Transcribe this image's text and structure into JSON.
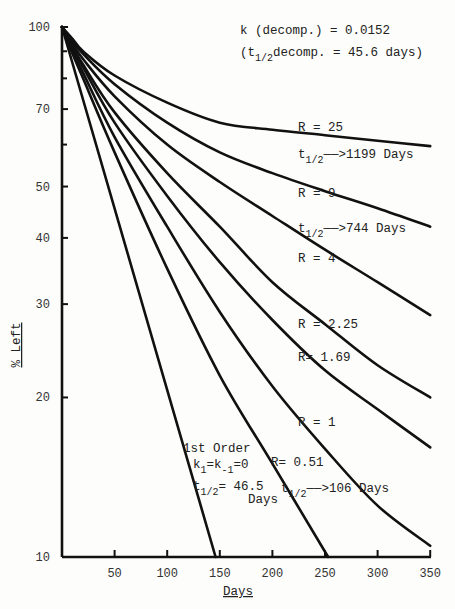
{
  "chart_data": {
    "type": "line",
    "title": "",
    "xlabel": "Days",
    "ylabel": "% Left",
    "xscale": "linear",
    "yscale": "log",
    "xlim": [
      0,
      350
    ],
    "ylim": [
      10,
      100
    ],
    "x_ticks": [
      50,
      100,
      150,
      200,
      250,
      300,
      350
    ],
    "y_ticks": [
      10,
      20,
      30,
      40,
      50,
      70,
      100
    ],
    "y_minor_ticks": [
      60,
      80,
      90
    ],
    "grid": false,
    "legend": "none (inline labels)",
    "series": [
      {
        "name": "1st Order (k1=k-1=0)",
        "points": [
          [
            0,
            100
          ],
          [
            146,
            10
          ]
        ]
      },
      {
        "name": "R = 0.51",
        "points": [
          [
            0,
            100
          ],
          [
            10,
            89
          ],
          [
            20,
            80
          ],
          [
            50,
            58
          ],
          [
            100,
            35
          ],
          [
            150,
            22
          ],
          [
            200,
            15
          ],
          [
            253,
            10
          ]
        ]
      },
      {
        "name": "R = 1",
        "points": [
          [
            0,
            100
          ],
          [
            10,
            90
          ],
          [
            20,
            82
          ],
          [
            50,
            62
          ],
          [
            100,
            42
          ],
          [
            150,
            29
          ],
          [
            200,
            21
          ],
          [
            250,
            16
          ],
          [
            300,
            12.5
          ],
          [
            350,
            10.5
          ]
        ]
      },
      {
        "name": "R = 1.69",
        "points": [
          [
            0,
            100
          ],
          [
            10,
            91
          ],
          [
            20,
            84
          ],
          [
            50,
            66
          ],
          [
            100,
            48
          ],
          [
            150,
            36
          ],
          [
            200,
            28
          ],
          [
            250,
            22.5
          ],
          [
            300,
            19
          ],
          [
            350,
            16.1
          ]
        ]
      },
      {
        "name": "R = 2.25",
        "points": [
          [
            0,
            100
          ],
          [
            10,
            92
          ],
          [
            20,
            85
          ],
          [
            50,
            69
          ],
          [
            100,
            53
          ],
          [
            150,
            42
          ],
          [
            200,
            33
          ],
          [
            250,
            27.5
          ],
          [
            300,
            23
          ],
          [
            350,
            20
          ]
        ]
      },
      {
        "name": "R = 4",
        "points": [
          [
            0,
            100
          ],
          [
            10,
            93
          ],
          [
            20,
            87
          ],
          [
            50,
            74
          ],
          [
            100,
            60
          ],
          [
            150,
            51
          ],
          [
            200,
            44
          ],
          [
            250,
            38
          ],
          [
            300,
            33
          ],
          [
            350,
            28.6
          ]
        ]
      },
      {
        "name": "R = 9",
        "points": [
          [
            0,
            100
          ],
          [
            10,
            94
          ],
          [
            20,
            89
          ],
          [
            50,
            78
          ],
          [
            100,
            66
          ],
          [
            150,
            58
          ],
          [
            200,
            53
          ],
          [
            250,
            49
          ],
          [
            300,
            45.5
          ],
          [
            350,
            42
          ]
        ]
      },
      {
        "name": "R = 25",
        "points": [
          [
            0,
            100
          ],
          [
            10,
            95
          ],
          [
            20,
            90
          ],
          [
            50,
            81
          ],
          [
            100,
            72
          ],
          [
            150,
            66
          ],
          [
            200,
            64
          ],
          [
            250,
            62.5
          ],
          [
            300,
            61
          ],
          [
            350,
            59.6
          ]
        ]
      }
    ],
    "annotations": [
      {
        "text": "k (decomp.) = 0.0152",
        "x_px": 240,
        "y_px": 34
      },
      {
        "text": "(t1/2 decomp. = 45.6 days)",
        "x_px": 240,
        "y_px": 56
      },
      {
        "text": "R = 25",
        "x_px": 298,
        "y_px": 131
      },
      {
        "text": "t1/2 → 1199 Days",
        "x_px": 298,
        "y_px": 158
      },
      {
        "text": "R = 9",
        "x_px": 298,
        "y_px": 197
      },
      {
        "text": "t1/2 → 744 Days",
        "x_px": 298,
        "y_px": 232
      },
      {
        "text": "R = 4",
        "x_px": 298,
        "y_px": 262
      },
      {
        "text": "R = 2.25",
        "x_px": 298,
        "y_px": 328
      },
      {
        "text": "R= 1.69",
        "x_px": 298,
        "y_px": 361
      },
      {
        "text": "R = 1",
        "x_px": 298,
        "y_px": 426
      },
      {
        "text": "1st Order",
        "x_px": 183,
        "y_px": 452
      },
      {
        "text": "k1=k-1=0",
        "x_px": 193,
        "y_px": 468
      },
      {
        "text": "R= 0.51",
        "x_px": 271,
        "y_px": 466
      },
      {
        "text": "t1/2= 46.5 Days",
        "x_px": 193,
        "y_px": 492
      },
      {
        "text": "t1/2 → 106 Days",
        "x_px": 279,
        "y_px": 492
      }
    ]
  },
  "labels": {
    "xlabel": "Days",
    "ylabel": "% Left",
    "decomp_k": "k (decomp.) = 0.0152",
    "decomp_t_open": "(t",
    "decomp_t_sub": "1/2",
    "decomp_t_rest": "decomp. = 45.6 days)",
    "r25": "R = 25",
    "r9": "R = 9",
    "r4": "R = 4",
    "r225": "R = 2.25",
    "r169": "R= 1.69",
    "r1": "R = 1",
    "r051": "R= 0.51",
    "t": "t",
    "half": "1/2",
    "arrow1199": "——>1199 Days",
    "arrow744": "——>744 Days",
    "arrow106": "——>106 Days",
    "first_order": "1st Order",
    "k_eq_a": "k",
    "k_sub1": "1",
    "k_eq_b": "=k",
    "k_sub2": "-1",
    "k_eq_c": "=0",
    "eq_465": "= 46.5",
    "days": "Days"
  }
}
